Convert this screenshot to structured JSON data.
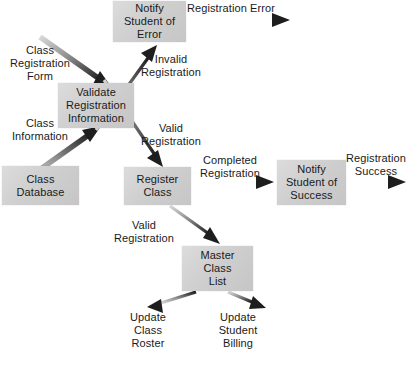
{
  "diagram": {
    "caption": "",
    "colors": {
      "node_fill": "#d2d2d2",
      "node_fill_light": "#dcdcdc",
      "text": "#1a1a1a",
      "arrow_dark": "#1e1e1e",
      "arrow_light": "#c9c9c9",
      "background": "#ffffff"
    },
    "nodes": [
      {
        "id": "notify_error",
        "label": "Notify\nStudent of\nError",
        "x": 113,
        "y": 1,
        "w": 73,
        "h": 41
      },
      {
        "id": "validate",
        "label": "Validate\nRegistration\nInformation",
        "x": 58,
        "y": 83,
        "w": 76,
        "h": 45
      },
      {
        "id": "class_database",
        "label": "Class\nDatabase",
        "x": 2,
        "y": 166,
        "w": 77,
        "h": 39
      },
      {
        "id": "register_class",
        "label": "Register\nClass",
        "x": 124,
        "y": 167,
        "w": 67,
        "h": 38
      },
      {
        "id": "notify_success",
        "label": "Notify\nStudent of\nSuccess",
        "x": 277,
        "y": 160,
        "w": 69,
        "h": 45
      },
      {
        "id": "master_list",
        "label": "Master\nClass\nList",
        "x": 182,
        "y": 246,
        "w": 71,
        "h": 45
      }
    ],
    "edge_labels": [
      {
        "id": "class_registration_form",
        "text": "Class\nRegistration\nForm",
        "x": 4,
        "y": 44,
        "w": 72
      },
      {
        "id": "class_information",
        "text": "Class\nInformation",
        "x": 4,
        "y": 117,
        "w": 72
      },
      {
        "id": "registration_error",
        "text": "Registration Error",
        "x": 187,
        "y": 2,
        "w": 104
      },
      {
        "id": "invalid_registration",
        "text": "Invalid\nRegistration",
        "x": 133,
        "y": 53,
        "w": 76
      },
      {
        "id": "valid_registration_1",
        "text": "Valid\nRegistration",
        "x": 133,
        "y": 122,
        "w": 76
      },
      {
        "id": "completed_registration",
        "text": "Completed\nRegistration",
        "x": 190,
        "y": 154,
        "w": 80
      },
      {
        "id": "registration_success",
        "text": "Registration\nSuccess",
        "x": 341,
        "y": 152,
        "w": 70
      },
      {
        "id": "valid_registration_2",
        "text": "Valid\nRegistration",
        "x": 106,
        "y": 219,
        "w": 76
      }
    ],
    "terminal_labels": [
      {
        "id": "update_class_roster",
        "text": "Update\nClass\nRoster",
        "x": 117,
        "y": 311,
        "w": 62
      },
      {
        "id": "update_student_billing",
        "text": "Update\nStudent\nBilling",
        "x": 205,
        "y": 311,
        "w": 66
      }
    ],
    "edges": [
      {
        "id": "form-to-validate",
        "from": "class_registration_form",
        "to": "validate",
        "style": "gradient-dark"
      },
      {
        "id": "database-to-validate",
        "from": "class_database",
        "to": "validate",
        "style": "gradient-dark"
      },
      {
        "id": "validate-to-notify-error",
        "from": "validate",
        "to": "notify_error",
        "style": "gradient-dark"
      },
      {
        "id": "validate-to-register",
        "from": "validate",
        "to": "register_class",
        "style": "gradient-dark"
      },
      {
        "id": "notify-error-to-out",
        "from": "notify_error",
        "to": "registration_error",
        "style": "gradient-dark"
      },
      {
        "id": "register-to-notify-success",
        "from": "register_class",
        "to": "notify_success",
        "style": "gradient-dark"
      },
      {
        "id": "notify-success-to-out",
        "from": "notify_success",
        "to": "registration_success",
        "style": "gradient-dark"
      },
      {
        "id": "register-to-master-list",
        "from": "register_class",
        "to": "master_list",
        "style": "gradient-dark"
      },
      {
        "id": "master-to-class-roster",
        "from": "master_list",
        "to": "update_class_roster",
        "style": "gradient-dark"
      },
      {
        "id": "master-to-student-billing",
        "from": "master_list",
        "to": "update_student_billing",
        "style": "gradient-dark"
      }
    ]
  }
}
